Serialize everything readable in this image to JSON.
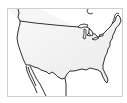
{
  "map": {
    "title": "",
    "subject": "Contiguous United States outline map",
    "colors": {
      "background": "#ffffff",
      "frame": "#cfcfcf",
      "land_fill": "#ececec",
      "land_highlight": "#f7f7f7",
      "outline": "#1a1a1a"
    },
    "features": [
      {
        "name": "united-states",
        "type": "country",
        "shaded": true
      },
      {
        "name": "canada-border",
        "type": "boundary"
      },
      {
        "name": "mexico-border",
        "type": "boundary"
      },
      {
        "name": "great-lakes",
        "type": "water"
      },
      {
        "name": "baja-california",
        "type": "peninsula"
      },
      {
        "name": "florida",
        "type": "peninsula"
      }
    ]
  }
}
